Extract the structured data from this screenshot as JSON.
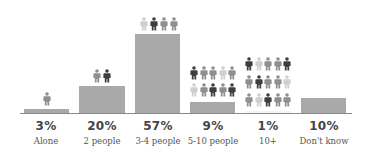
{
  "chart_data": {
    "type": "bar",
    "title": "",
    "xlabel": "",
    "ylabel": "",
    "ylim": [
      0,
      60
    ],
    "grid": false,
    "legend": null,
    "categories": [
      "Alone",
      "2 people",
      "3-4 people",
      "5-10 people",
      "10+",
      "Don't know"
    ],
    "values": [
      3,
      20,
      57,
      9,
      1,
      10
    ],
    "value_labels": [
      "3%",
      "20%",
      "57%",
      "9%",
      "1%",
      "10%"
    ],
    "annotations": [
      {
        "category": "Alone",
        "person_icons": 1
      },
      {
        "category": "2 people",
        "person_icons": 2
      },
      {
        "category": "3-4 people",
        "person_icons": 4
      },
      {
        "category": "5-10 people",
        "person_icons": 10
      },
      {
        "category": "10+",
        "person_icons": 15
      },
      {
        "category": "Don't know",
        "person_icons": 0
      }
    ]
  },
  "colors": {
    "bar": "#a9a9a9",
    "icon_dark": "#3e3e3e",
    "icon_mid": "#8f8f8f",
    "icon_light": "#cfcfcf"
  },
  "bars": [
    {
      "pct": "3%",
      "label": "Alone"
    },
    {
      "pct": "20%",
      "label": "2 people"
    },
    {
      "pct": "57%",
      "label": "3-4 people"
    },
    {
      "pct": "9%",
      "label": "5-10 people"
    },
    {
      "pct": "1%",
      "label": "10+"
    },
    {
      "pct": "10%",
      "label": "Don't know"
    }
  ]
}
